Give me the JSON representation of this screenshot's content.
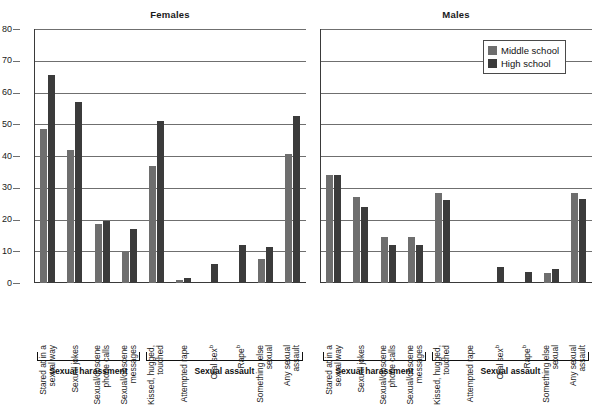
{
  "chart_data": {
    "type": "bar",
    "title": "",
    "xlabel": "",
    "ylabel": "",
    "ylim": [
      0,
      80
    ],
    "yticks": [
      0,
      10,
      20,
      30,
      40,
      50,
      60,
      70,
      80
    ],
    "grid": true,
    "legend": {
      "position": "top-right",
      "entries": [
        {
          "name": "Middle school",
          "color": "#6e6e6e"
        },
        {
          "name": "High school",
          "color": "#3b3b3b"
        }
      ]
    },
    "panels": [
      {
        "title": "Females",
        "sections": [
          {
            "label": "Sexual harassment",
            "categories": [
              {
                "label": "Stared at in a sexual way",
                "lines": [
                  "Stared at in a",
                  "sexual way"
                ],
                "footnote": "",
                "middle_school": 48.5,
                "high_school": 65.5
              },
              {
                "label": "Sexual jokes",
                "lines": [
                  "Sexual jokes"
                ],
                "footnote": "",
                "middle_school": 42.0,
                "high_school": 57.0
              },
              {
                "label": "Sexual/obscene phone calls",
                "lines": [
                  "Sexual/obscene",
                  "phone calls"
                ],
                "footnote": "",
                "middle_school": 18.5,
                "high_school": 19.5
              },
              {
                "label": "Sexual/obscene messages",
                "lines": [
                  "Sexual/obscene",
                  "messages"
                ],
                "footnote": "",
                "middle_school": 9.8,
                "high_school": 17.0
              }
            ]
          },
          {
            "label": "Sexual assault",
            "categories": [
              {
                "label": "Kissed, hugged, touched",
                "lines": [
                  "Kissed, hugged,",
                  "touched"
                ],
                "footnote": "",
                "middle_school": 37.0,
                "high_school": 51.0
              },
              {
                "label": "Attempted rape",
                "lines": [
                  "Attempted rape"
                ],
                "footnote": "",
                "middle_school": 1.0,
                "high_school": 1.5
              },
              {
                "label": "Oral sex",
                "lines": [
                  "Oral sex"
                ],
                "footnote": "b",
                "middle_school": null,
                "high_school": 6.0
              },
              {
                "label": "Rape",
                "lines": [
                  "Rape"
                ],
                "footnote": "b",
                "middle_school": null,
                "high_school": 12.0
              },
              {
                "label": "Something else sexual",
                "lines": [
                  "Something else",
                  "sexual"
                ],
                "footnote": "",
                "middle_school": 7.5,
                "high_school": 11.5
              },
              {
                "label": "Any sexual assault",
                "lines": [
                  "Any sexual",
                  "assault"
                ],
                "footnote": "",
                "middle_school": 40.5,
                "high_school": 52.5
              }
            ]
          }
        ]
      },
      {
        "title": "Males",
        "sections": [
          {
            "label": "Sexual harassment",
            "categories": [
              {
                "label": "Stared at in a sexual way",
                "lines": [
                  "Stared at in a",
                  "sexual way"
                ],
                "footnote": "",
                "middle_school": 34.0,
                "high_school": 34.0
              },
              {
                "label": "Sexual jokes",
                "lines": [
                  "Sexual jokes"
                ],
                "footnote": "",
                "middle_school": 27.0,
                "high_school": 24.0
              },
              {
                "label": "Sexual/obscene phone calls",
                "lines": [
                  "Sexual/obscene",
                  "phone calls"
                ],
                "footnote": "",
                "middle_school": 14.5,
                "high_school": 12.0
              },
              {
                "label": "Sexual/obscene messages",
                "lines": [
                  "Sexual/obscene",
                  "messages"
                ],
                "footnote": "",
                "middle_school": 14.5,
                "high_school": 12.0
              }
            ]
          },
          {
            "label": "Sexual assault",
            "categories": [
              {
                "label": "Kissed, hugged, touched",
                "lines": [
                  "Kissed, hugged,",
                  "touched"
                ],
                "footnote": "",
                "middle_school": 28.5,
                "high_school": 26.0
              },
              {
                "label": "Attempted rape",
                "lines": [
                  "Attempted rape"
                ],
                "footnote": "",
                "middle_school": 0,
                "high_school": 0
              },
              {
                "label": "Oral sex",
                "lines": [
                  "Oral sex"
                ],
                "footnote": "b",
                "middle_school": null,
                "high_school": 5.0
              },
              {
                "label": "Rape",
                "lines": [
                  "Rape"
                ],
                "footnote": "b",
                "middle_school": null,
                "high_school": 3.5
              },
              {
                "label": "Something else sexual",
                "lines": [
                  "Something else",
                  "sexual"
                ],
                "footnote": "",
                "middle_school": 3.0,
                "high_school": 4.5
              },
              {
                "label": "Any sexual assault",
                "lines": [
                  "Any sexual",
                  "assault"
                ],
                "footnote": "",
                "middle_school": 28.5,
                "high_school": 26.5
              }
            ]
          }
        ]
      }
    ]
  }
}
